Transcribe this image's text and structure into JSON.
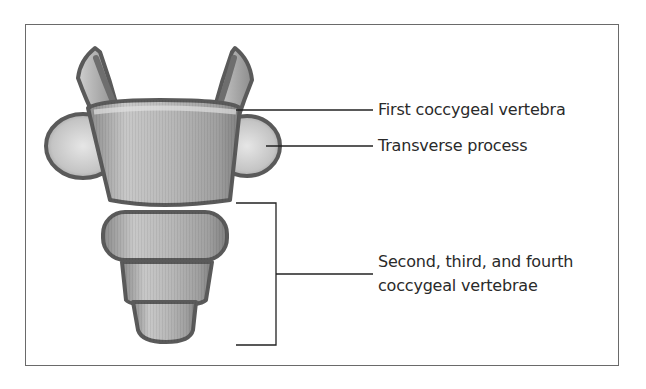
{
  "diagram": {
    "labels": [
      {
        "id": "first-coccygeal-vertebra",
        "text": "First coccygeal vertebra"
      },
      {
        "id": "transverse-process",
        "text": "Transverse process"
      },
      {
        "id": "lower-coccygeal-vertebrae",
        "line1": "Second, third, and fourth",
        "line2": "coccygeal vertebrae"
      }
    ],
    "colors": {
      "outline": "#5a5a5a",
      "bone_fill": "#a8a8a8",
      "bone_light": "#d8d8d8",
      "frame": "#6a6a6a",
      "leader": "#222222"
    }
  }
}
